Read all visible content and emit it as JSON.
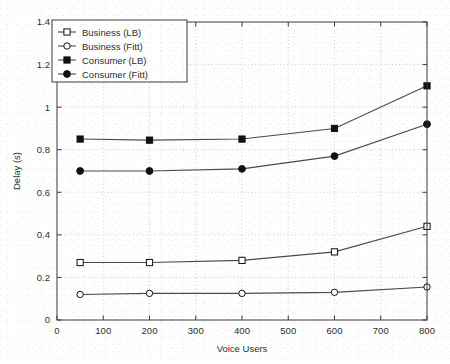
{
  "chart_data": {
    "type": "line",
    "title": "",
    "xlabel": "Voice Users",
    "ylabel": "Delay (s)",
    "xlim": [
      0,
      800
    ],
    "ylim": [
      0,
      1.4
    ],
    "xticks": [
      0,
      100,
      200,
      300,
      400,
      500,
      600,
      700,
      800
    ],
    "xticklabels": [
      "0",
      "100",
      "200",
      "300",
      "400",
      "500",
      "600",
      "700",
      "800"
    ],
    "yticks": [
      0,
      0.2,
      0.4,
      0.6,
      0.8,
      1.0,
      1.2,
      1.4
    ],
    "yticklabels": [
      "0",
      "0.2",
      "0.4",
      "0.6",
      "0.8",
      "1",
      "1.2",
      "1.4"
    ],
    "grid": true,
    "grid_style": "dotted",
    "legend_position": "upper-left",
    "x": [
      50,
      200,
      400,
      600,
      800
    ],
    "series": [
      {
        "name": "Business (LB)",
        "marker": "open-square",
        "values": [
          0.27,
          0.27,
          0.28,
          0.32,
          0.44
        ]
      },
      {
        "name": "Business (Fitt)",
        "marker": "open-circle",
        "values": [
          0.12,
          0.125,
          0.125,
          0.13,
          0.155
        ]
      },
      {
        "name": "Consumer (LB)",
        "marker": "filled-square",
        "values": [
          0.85,
          0.845,
          0.85,
          0.9,
          1.1
        ]
      },
      {
        "name": "Consumer (Fitt)",
        "marker": "filled-circle",
        "values": [
          0.7,
          0.7,
          0.71,
          0.77,
          0.92
        ]
      }
    ],
    "colors": {
      "line": "#4a4a4a",
      "marker": "#111111",
      "axis": "#3a3a3a",
      "grid": "#c9c9c9",
      "background": "#ffffff"
    }
  }
}
